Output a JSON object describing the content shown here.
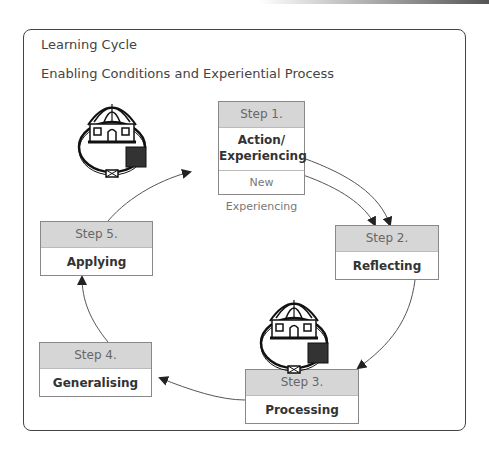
{
  "diagram": {
    "title": "Learning Cycle",
    "subtitle": "Enabling Conditions and Experiential Process",
    "steps": [
      {
        "step": "Step 1.",
        "label": "Action/ Experiencing",
        "sub": "New Experiencing"
      },
      {
        "step": "Step 2.",
        "label": "Reflecting"
      },
      {
        "step": "Step 3.",
        "label": "Processing"
      },
      {
        "step": "Step 4.",
        "label": "Generalising"
      },
      {
        "step": "Step 5.",
        "label": "Applying"
      }
    ],
    "icons": [
      "house-in-circle-icon",
      "house-in-circle-icon"
    ],
    "colors": {
      "header_fill": "#d6d6d6",
      "border": "#888888",
      "text": "#333333"
    }
  }
}
